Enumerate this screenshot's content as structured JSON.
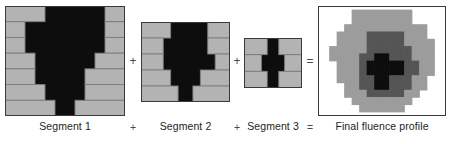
{
  "figure": {
    "colors": {
      "background": "#ffffff",
      "leaf": "#b3b3b3",
      "leaf_edge": "#7d7d7d",
      "aperture": "#0d0d0d",
      "panel_border": "#3a3a3a",
      "fluence_level1": "#9c9c9c",
      "fluence_level2": "#555555",
      "fluence_level3": "#0d0d0d",
      "text": "#1d1d1d",
      "operator": "#4a4a4a"
    }
  },
  "operators": {
    "plus": "+",
    "equals": "="
  },
  "captions": {
    "segment1": "Segment 1",
    "op1": "+",
    "segment2": "Segment 2",
    "op2": "+",
    "segment3": "Segment 3",
    "op3": "=",
    "result": "Final fluence profile"
  },
  "panels": [
    {
      "id": "segment-1",
      "label": "Segment 1",
      "x": 5,
      "y": 6,
      "width": 120,
      "height": 110,
      "leaf_rows": 7,
      "grid_cols": 12,
      "leaf_pairs": [
        {
          "row": 0,
          "left_close": 4,
          "right_open": 10
        },
        {
          "row": 1,
          "left_close": 2,
          "right_open": 10
        },
        {
          "row": 2,
          "left_close": 2,
          "right_open": 10
        },
        {
          "row": 3,
          "left_close": 3,
          "right_open": 9
        },
        {
          "row": 4,
          "left_close": 3,
          "right_open": 8
        },
        {
          "row": 5,
          "left_close": 4,
          "right_open": 8
        },
        {
          "row": 6,
          "left_close": 5,
          "right_open": 7
        }
      ]
    },
    {
      "id": "segment-2",
      "label": "Segment 2",
      "x": 141,
      "y": 22,
      "width": 89,
      "height": 80,
      "leaf_rows": 5,
      "grid_cols": 12,
      "leaf_pairs": [
        {
          "row": 0,
          "left_close": 4,
          "right_open": 9
        },
        {
          "row": 1,
          "left_close": 3,
          "right_open": 9
        },
        {
          "row": 2,
          "left_close": 3,
          "right_open": 10
        },
        {
          "row": 3,
          "left_close": 4,
          "right_open": 8
        },
        {
          "row": 4,
          "left_close": 5,
          "right_open": 7
        }
      ]
    },
    {
      "id": "segment-3",
      "label": "Segment 3",
      "x": 244,
      "y": 38,
      "width": 58,
      "height": 50,
      "leaf_rows": 3,
      "grid_cols": 10,
      "leaf_pairs": [
        {
          "row": 0,
          "left_close": 4,
          "right_open": 6
        },
        {
          "row": 1,
          "left_close": 3,
          "right_open": 7
        },
        {
          "row": 2,
          "left_close": 4,
          "right_open": 6
        }
      ]
    }
  ],
  "result_panel": {
    "id": "final-fluence-profile",
    "label": "Final fluence profile",
    "x": 318,
    "y": 6,
    "width": 128,
    "height": 110,
    "grid_cols": 16,
    "grid_rows": 14,
    "levels": [
      0,
      1,
      2,
      3
    ],
    "level_legend": [
      {
        "level": 0,
        "name": "no dose",
        "color": "#ffffff"
      },
      {
        "level": 1,
        "name": "one segment",
        "color": "#9c9c9c"
      },
      {
        "level": 2,
        "name": "two segments",
        "color": "#555555"
      },
      {
        "level": 3,
        "name": "three segments",
        "color": "#0d0d0d"
      }
    ],
    "grid": [
      [
        0,
        0,
        0,
        0,
        1,
        1,
        1,
        1,
        1,
        1,
        1,
        1,
        0,
        0,
        0,
        0
      ],
      [
        0,
        0,
        0,
        0,
        1,
        1,
        1,
        1,
        1,
        1,
        1,
        1,
        0,
        0,
        0,
        0
      ],
      [
        0,
        0,
        0,
        1,
        1,
        1,
        1,
        1,
        1,
        1,
        1,
        1,
        1,
        1,
        0,
        0
      ],
      [
        0,
        0,
        1,
        1,
        1,
        1,
        2,
        2,
        2,
        2,
        2,
        1,
        1,
        1,
        0,
        0
      ],
      [
        0,
        0,
        1,
        1,
        1,
        1,
        2,
        2,
        2,
        2,
        2,
        1,
        1,
        1,
        1,
        0
      ],
      [
        0,
        1,
        1,
        1,
        1,
        1,
        2,
        2,
        2,
        2,
        2,
        2,
        1,
        1,
        1,
        0
      ],
      [
        0,
        1,
        1,
        1,
        1,
        2,
        2,
        3,
        3,
        2,
        2,
        2,
        1,
        1,
        1,
        0
      ],
      [
        0,
        0,
        1,
        1,
        1,
        2,
        3,
        3,
        3,
        3,
        3,
        2,
        2,
        1,
        1,
        0
      ],
      [
        0,
        0,
        1,
        1,
        1,
        2,
        3,
        3,
        3,
        3,
        3,
        2,
        2,
        1,
        1,
        0
      ],
      [
        0,
        0,
        1,
        1,
        1,
        2,
        2,
        3,
        3,
        2,
        2,
        2,
        1,
        1,
        0,
        0
      ],
      [
        0,
        0,
        0,
        1,
        1,
        2,
        2,
        3,
        3,
        2,
        2,
        2,
        1,
        1,
        0,
        0
      ],
      [
        0,
        0,
        0,
        1,
        1,
        1,
        2,
        2,
        2,
        2,
        2,
        1,
        1,
        0,
        0,
        0
      ],
      [
        0,
        0,
        0,
        0,
        1,
        1,
        1,
        1,
        1,
        1,
        1,
        1,
        0,
        0,
        0,
        0
      ],
      [
        0,
        0,
        0,
        0,
        0,
        1,
        1,
        1,
        1,
        1,
        1,
        0,
        0,
        0,
        0,
        0
      ]
    ]
  }
}
